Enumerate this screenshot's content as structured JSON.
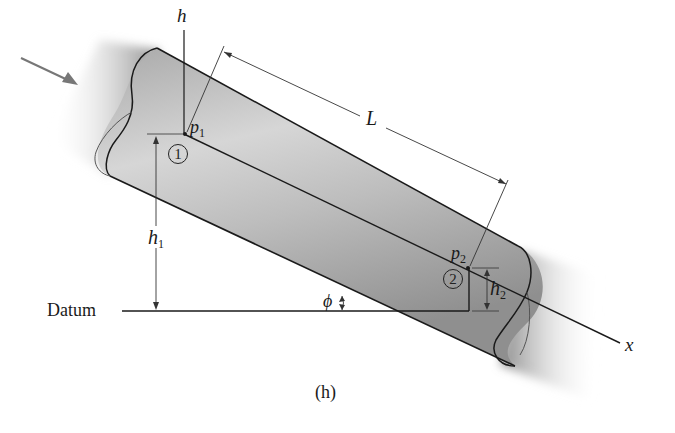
{
  "figure": {
    "caption": "(h)",
    "labels": {
      "h_axis": "h",
      "x_axis": "x",
      "length": "L",
      "p1": "p",
      "p1_sub": "1",
      "p2": "p",
      "p2_sub": "2",
      "h1": "h",
      "h1_sub": "1",
      "h2": "h",
      "h2_sub": "2",
      "angle": "ϕ",
      "datum": "Datum",
      "section1": "1",
      "section2": "2"
    },
    "colors": {
      "pipe_fill": "#b8b8b8",
      "pipe_shadow": "#9a9a9a",
      "line": "#1a1a1a",
      "arrow": "#777777"
    }
  }
}
